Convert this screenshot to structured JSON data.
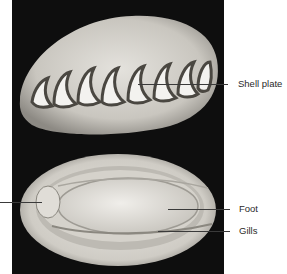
{
  "figure": {
    "panels": [
      {
        "view": "dorsal",
        "description": "Top view showing eight overlapping shell plates"
      },
      {
        "view": "ventral",
        "description": "Underside view showing foot, gills, and head region"
      }
    ],
    "labels": [
      {
        "id": "shell-plate",
        "text": "Shell plate"
      },
      {
        "id": "foot",
        "text": "Foot"
      },
      {
        "id": "gills",
        "text": "Gills"
      },
      {
        "id": "unlabeled-left",
        "text": ""
      }
    ],
    "colors": {
      "background": "#0e0e0e",
      "specimen": "#d9d6d0",
      "label_text": "#2a2a2a",
      "leader_line": "#3a3a3a"
    }
  }
}
